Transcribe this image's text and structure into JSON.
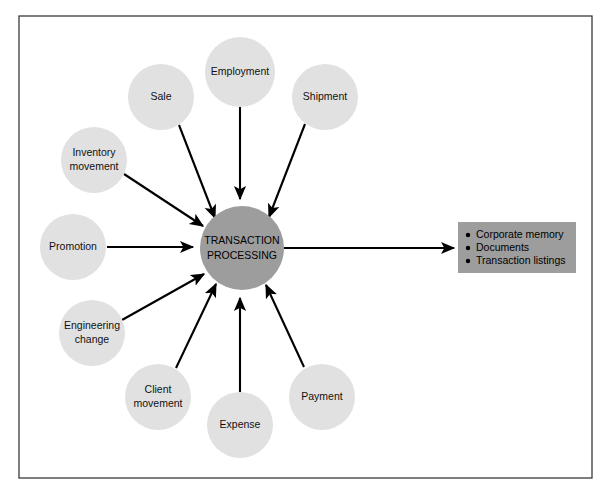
{
  "diagram": {
    "type": "hub-and-spoke",
    "hub": {
      "label_line1": "TRANSACTION",
      "label_line2": "PROCESSING",
      "cx": 242,
      "cy": 248,
      "r": 42,
      "fill": "#9d9d9d"
    },
    "input_nodes": [
      {
        "id": "sale",
        "label_line1": "Sale",
        "label_line2": "",
        "cx": 161,
        "cy": 97,
        "r": 33
      },
      {
        "id": "employment",
        "label_line1": "Employment",
        "label_line2": "",
        "cx": 240,
        "cy": 72,
        "r": 35
      },
      {
        "id": "shipment",
        "label_line1": "Shipment",
        "label_line2": "",
        "cx": 325,
        "cy": 97,
        "r": 33
      },
      {
        "id": "inventory-movement",
        "label_line1": "Inventory",
        "label_line2": "movement",
        "cx": 94,
        "cy": 160,
        "r": 33
      },
      {
        "id": "promotion",
        "label_line1": "Promotion",
        "label_line2": "",
        "cx": 73,
        "cy": 247,
        "r": 33
      },
      {
        "id": "engineering-change",
        "label_line1": "Engineering",
        "label_line2": "change",
        "cx": 92,
        "cy": 333,
        "r": 33
      },
      {
        "id": "client-movement",
        "label_line1": "Client",
        "label_line2": "movement",
        "cx": 158,
        "cy": 397,
        "r": 33
      },
      {
        "id": "expense",
        "label_line1": "Expense",
        "label_line2": "",
        "cx": 240,
        "cy": 425,
        "r": 33
      },
      {
        "id": "payment",
        "label_line1": "Payment",
        "label_line2": "",
        "cx": 322,
        "cy": 397,
        "r": 33
      }
    ],
    "output_box": {
      "x": 458,
      "y": 222,
      "width": 118,
      "height": 51,
      "fill": "#9d9d9d",
      "items": [
        "Corporate memory",
        "Documents",
        "Transaction listings"
      ]
    },
    "frame": {
      "x": 19,
      "y": 16,
      "width": 573,
      "height": 462,
      "stroke": "#3a3a3a"
    },
    "colors": {
      "node_fill": "#e1e1e1",
      "hub_fill": "#9d9d9d",
      "box_fill": "#9d9d9d",
      "line": "#000000",
      "background": "#ffffff"
    }
  }
}
